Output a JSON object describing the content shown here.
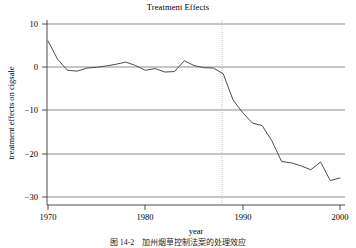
{
  "chart_data": {
    "type": "line",
    "title": "Treatment Effects",
    "xlabel": "year",
    "ylabel": "treatment effects on cigsale",
    "xlim": [
      1970,
      2000
    ],
    "ylim": [
      -30,
      10
    ],
    "xticks": [
      1970,
      1980,
      1990,
      2000
    ],
    "xtick_labels": [
      "1970",
      "1980",
      "1990",
      "2000"
    ],
    "yticks": [
      10,
      0,
      -10,
      -20,
      -30
    ],
    "ytick_labels": [
      "10",
      "0",
      "−10",
      "−20",
      "−30"
    ],
    "grid": "horizontal",
    "legend": "none",
    "series": [
      {
        "name": "treatment effect",
        "color": "#4d4d4d",
        "x": [
          1970,
          1971,
          1972,
          1973,
          1974,
          1975,
          1976,
          1977,
          1978,
          1979,
          1980,
          1981,
          1982,
          1983,
          1984,
          1985,
          1986,
          1987,
          1988,
          1989,
          1990,
          1991,
          1992,
          1993,
          1994,
          1995,
          1996,
          1997,
          1998,
          1999,
          2000
        ],
        "values": [
          6.1,
          1.8,
          -0.7,
          -0.9,
          -0.2,
          0.0,
          0.3,
          0.7,
          1.2,
          0.4,
          -0.7,
          -0.3,
          -1.1,
          -1.0,
          1.5,
          0.4,
          -0.1,
          -0.2,
          -1.5,
          -7.5,
          -10.5,
          -12.9,
          -13.5,
          -17.0,
          -21.8,
          -22.1,
          -22.8,
          -23.7,
          -21.9,
          -26.2,
          -25.6
        ]
      }
    ],
    "annotations": [
      {
        "kind": "vertical-reference-line",
        "x": 1988,
        "style": "dotted",
        "color": "#bfbfbf"
      }
    ],
    "gridline_color": "#8c8c8c",
    "axis_color": "#4d4d4d"
  },
  "caption": {
    "text": "图 14-2　加州烟草控制法案的处理效应"
  }
}
